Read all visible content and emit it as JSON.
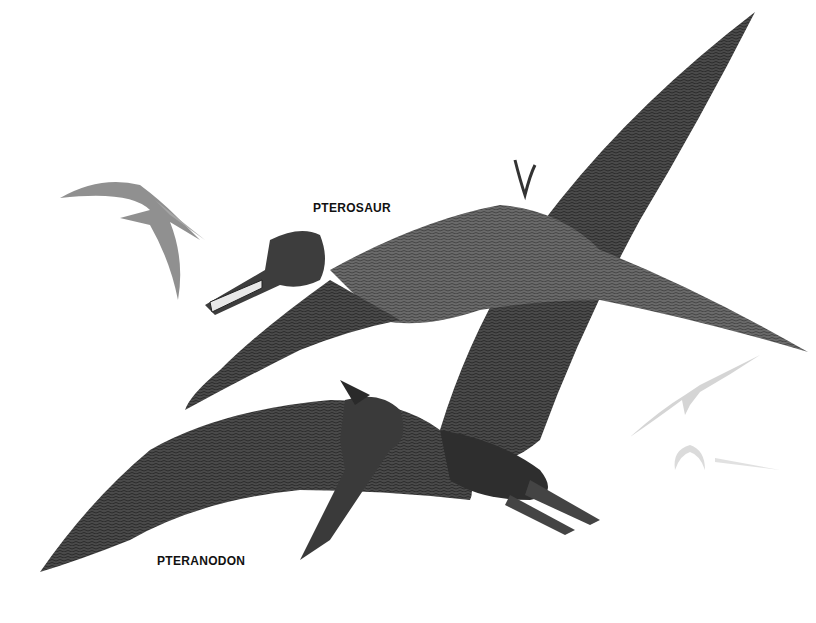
{
  "illustration": {
    "description": "Pencil drawing of pterosaurs in flight",
    "background_color": "#ffffff",
    "ink_color": "#3a3a3a",
    "labels": {
      "pterosaur": "PTEROSAUR",
      "pteranodon": "PTERANODON"
    },
    "figures": [
      {
        "name": "pteranodon-large",
        "position": "center-right foreground"
      },
      {
        "name": "pterosaur-toothed",
        "position": "center upper"
      },
      {
        "name": "pterosaur-distant-left",
        "position": "upper left"
      },
      {
        "name": "pterosaur-faint-right-1",
        "position": "right middle"
      },
      {
        "name": "pterosaur-faint-right-2",
        "position": "right lower"
      }
    ]
  }
}
